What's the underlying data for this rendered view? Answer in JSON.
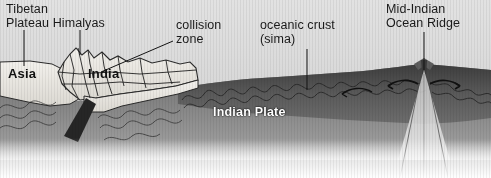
{
  "figure": {
    "kind": "geological-cross-section",
    "width_px": 491,
    "height_px": 178
  },
  "labels": {
    "tibetan": "Tibetan\nPlateau Himalyas",
    "collision": "collision\nzone",
    "oceanic": "oceanic crust\n(sima)",
    "ridge": "Mid-Indian\nOcean Ridge",
    "asia": "Asia",
    "india": "India",
    "indian_plate": "Indian Plate"
  },
  "colors": {
    "sky": "#d8d8d8",
    "continent_light": "#e9e7e2",
    "oceanic_crust_dark": "#4a4a4a",
    "mantle_mid": "#7c7c7c",
    "mantle_deep": "#8e8e8e",
    "slab_dark": "#2a2a2a",
    "leader_line": "#1a1a1a",
    "label_text": "#1a1a1a",
    "label_text_inverse": "#ffffff"
  },
  "annotations": {
    "leader_lines": [
      {
        "name": "tibetan-plateau-leader",
        "from": [
          24,
          30
        ],
        "to": [
          24,
          66
        ]
      },
      {
        "name": "himalaya-peak-leader",
        "from": [
          80,
          30
        ],
        "to": [
          80,
          56
        ]
      },
      {
        "name": "collision-zone-leader",
        "from": [
          172,
          41
        ],
        "to": [
          101,
          72
        ]
      },
      {
        "name": "oceanic-crust-leader",
        "from": [
          307,
          48
        ],
        "to": [
          307,
          89
        ]
      },
      {
        "name": "mid-ocean-ridge-leader",
        "from": [
          424,
          32
        ],
        "to": [
          424,
          70
        ]
      }
    ],
    "spreading_arrows": [
      {
        "name": "spreading-arrow-left",
        "direction": "west"
      },
      {
        "name": "spreading-arrow-right",
        "direction": "east"
      }
    ]
  }
}
